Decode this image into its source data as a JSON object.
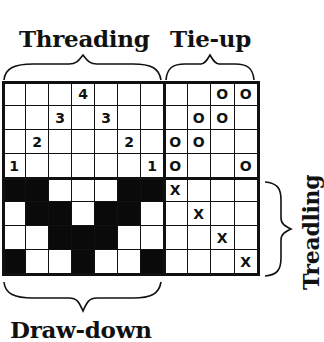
{
  "labels": {
    "threading": "Threading",
    "tieup": "Tie-up",
    "treadling": "Treadling",
    "drawdown": "Draw-down"
  },
  "threading": {
    "columns": 7,
    "rows": 4,
    "cells": [
      [
        "",
        "",
        "",
        "4",
        "",
        "",
        ""
      ],
      [
        "",
        "",
        "3",
        "",
        "3",
        "",
        ""
      ],
      [
        "",
        "2",
        "",
        "",
        "",
        "2",
        ""
      ],
      [
        "1",
        "",
        "",
        "",
        "",
        "",
        "1"
      ]
    ]
  },
  "tieup": {
    "columns": 4,
    "rows": 4,
    "cells": [
      [
        "",
        "",
        "O",
        "O"
      ],
      [
        "",
        "O",
        "O",
        ""
      ],
      [
        "O",
        "O",
        "",
        ""
      ],
      [
        "O",
        "",
        "",
        "O"
      ]
    ]
  },
  "treadling": {
    "columns": 4,
    "rows": 4,
    "cells": [
      [
        "X",
        "",
        "",
        ""
      ],
      [
        "",
        "X",
        "",
        ""
      ],
      [
        "",
        "",
        "X",
        ""
      ],
      [
        "",
        "",
        "",
        "X"
      ]
    ]
  },
  "drawdown": {
    "columns": 7,
    "rows": 4,
    "cells": [
      [
        1,
        1,
        0,
        0,
        0,
        1,
        1
      ],
      [
        0,
        1,
        1,
        0,
        1,
        1,
        0
      ],
      [
        0,
        0,
        1,
        1,
        1,
        0,
        0
      ],
      [
        1,
        0,
        0,
        1,
        0,
        0,
        1
      ]
    ]
  },
  "colors": {
    "ink": "#111111",
    "paper": "#ffffff",
    "filled": "#0a0a0a"
  }
}
